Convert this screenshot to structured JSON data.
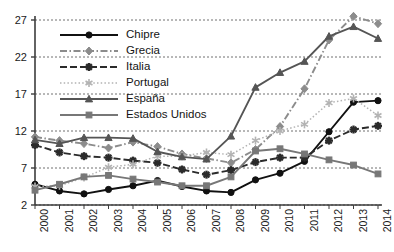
{
  "chart_data": {
    "type": "line",
    "title": "",
    "xlabel": "",
    "ylabel": "",
    "categories": [
      "2000",
      "2001",
      "2002",
      "2003",
      "2004",
      "2005",
      "2006",
      "2007",
      "2008",
      "2009",
      "2010",
      "2011",
      "2012",
      "2013",
      "2014"
    ],
    "xlim": [
      2000,
      2014
    ],
    "ylim": [
      2,
      29
    ],
    "yticks": [
      2,
      7,
      12,
      17,
      22,
      27
    ],
    "grid": "horizontal-dotted",
    "legend_position": "top-left-inside",
    "series": [
      {
        "name": "Chipre",
        "color": "#111111",
        "marker": "circle",
        "linestyle": "solid",
        "values": [
          4.8,
          3.9,
          3.5,
          4.1,
          4.6,
          5.3,
          4.5,
          3.9,
          3.7,
          5.4,
          6.3,
          7.9,
          11.9,
          15.9,
          16.1
        ]
      },
      {
        "name": "Grecia",
        "color": "#8c8c8c",
        "marker": "diamond",
        "linestyle": "dashdot",
        "values": [
          11.2,
          10.7,
          10.3,
          9.7,
          10.5,
          9.9,
          8.9,
          8.3,
          7.7,
          9.5,
          12.6,
          17.7,
          24.3,
          27.5,
          26.5
        ]
      },
      {
        "name": "Italia",
        "color": "#2b2b2b",
        "marker": "star",
        "linestyle": "dashed",
        "values": [
          10.1,
          9.1,
          8.6,
          8.4,
          8.0,
          7.7,
          6.8,
          6.1,
          6.7,
          7.8,
          8.4,
          8.4,
          10.7,
          12.2,
          12.7
        ]
      },
      {
        "name": "Portugal",
        "color": "#b3b3b3",
        "marker": "asterisk",
        "linestyle": "dotted",
        "values": [
          4.5,
          4.6,
          5.7,
          7.1,
          7.5,
          8.6,
          8.6,
          9.1,
          8.8,
          10.7,
          12.0,
          12.9,
          15.8,
          16.4,
          14.1
        ]
      },
      {
        "name": "España",
        "color": "#555555",
        "marker": "triangle",
        "linestyle": "solid",
        "values": [
          10.8,
          10.3,
          11.1,
          11.1,
          11.0,
          9.2,
          8.5,
          8.2,
          11.3,
          17.9,
          19.9,
          21.4,
          24.8,
          26.1,
          24.5
        ]
      },
      {
        "name": "Estados Unidos",
        "color": "#777777",
        "marker": "square",
        "linestyle": "solid",
        "values": [
          4.0,
          4.8,
          5.8,
          6.0,
          5.5,
          5.1,
          4.6,
          4.6,
          5.8,
          9.3,
          9.6,
          8.9,
          8.1,
          7.4,
          6.2
        ]
      }
    ]
  },
  "legend": {
    "items": [
      {
        "label": "Chipre"
      },
      {
        "label": "Grecia"
      },
      {
        "label": "Italia"
      },
      {
        "label": "Portugal"
      },
      {
        "label": "España"
      },
      {
        "label": "Estados Unidos"
      }
    ]
  }
}
